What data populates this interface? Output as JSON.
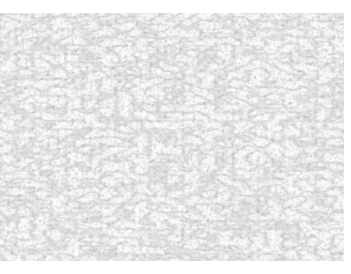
{
  "image": {
    "description": "grayscale granular noise texture",
    "colors": {
      "background": "#ffffff",
      "light": "#f2f2f2",
      "mid": "#b8b8b8",
      "dark": "#6a6a6a"
    },
    "bounds": {
      "left": 0,
      "top": 13,
      "width": 344,
      "height": 248
    }
  }
}
